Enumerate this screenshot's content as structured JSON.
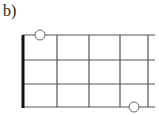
{
  "label": "b)",
  "diagram": {
    "type": "fretboard",
    "strings": 4,
    "frets_shown": 4,
    "nut": true,
    "markers": [
      {
        "string_row": 0,
        "position": "between nut and fret 1",
        "style": "open-circle"
      },
      {
        "string_row": 3,
        "position": "between fret 3 and fret 4",
        "style": "open-circle"
      }
    ],
    "colors": {
      "line": "#444444",
      "nut": "#111111",
      "marker_fill": "#ffffff"
    }
  }
}
